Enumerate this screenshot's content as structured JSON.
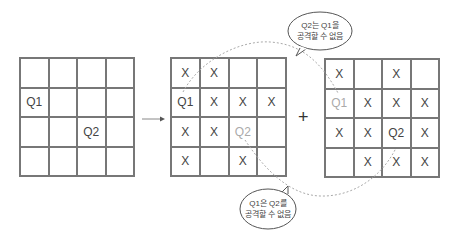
{
  "diagram": {
    "operator_plus": "+",
    "left_grid": {
      "cells": [
        [
          "",
          "",
          "",
          ""
        ],
        [
          "Q1",
          "",
          "",
          ""
        ],
        [
          "",
          "",
          "Q2",
          ""
        ],
        [
          "",
          "",
          "",
          ""
        ]
      ]
    },
    "middle_grid": {
      "cells": [
        [
          "X",
          "X",
          "",
          ""
        ],
        [
          "Q1",
          "X",
          "X",
          "X"
        ],
        [
          "X",
          "X",
          "Q2",
          ""
        ],
        [
          "X",
          "",
          "X",
          ""
        ]
      ],
      "dim_cells": [
        "2-2"
      ]
    },
    "right_grid": {
      "cells": [
        [
          "X",
          "",
          "X",
          ""
        ],
        [
          "Q1",
          "X",
          "X",
          "X"
        ],
        [
          "X",
          "X",
          "Q2",
          "X"
        ],
        [
          "",
          "X",
          "X",
          "X"
        ]
      ],
      "dim_cells": [
        "1-0"
      ]
    },
    "callout_top": {
      "line1": "Q2는 Q1을",
      "line2": "공격할 수 없음"
    },
    "callout_bottom": {
      "line1": "Q1은 Q2를",
      "line2": "공격할 수 없음"
    },
    "colors": {
      "grid_line": "#777777",
      "text": "#444444",
      "dim_text": "#aaaaaa",
      "dashed_curve": "#aaaaaa"
    }
  }
}
